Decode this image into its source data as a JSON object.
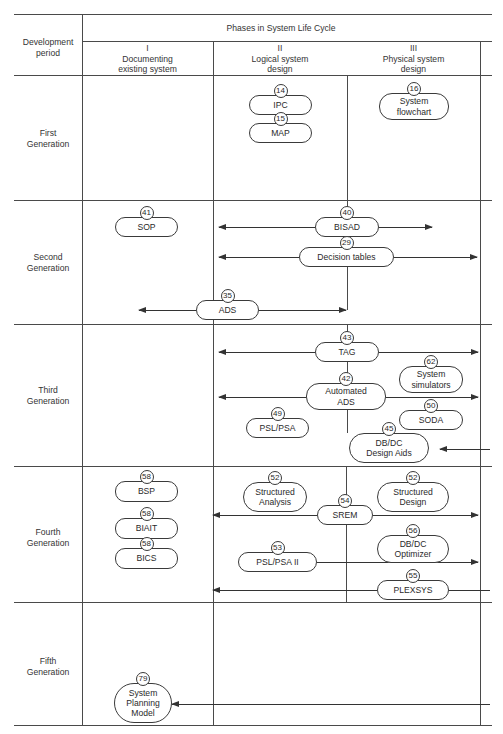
{
  "table": {
    "corner_header": "Development\nperiod",
    "phases_header": "Phases in System Life Cycle",
    "phases": [
      {
        "numeral": "I",
        "label": "Documenting\nexisting system"
      },
      {
        "numeral": "II",
        "label": "Logical system\ndesign"
      },
      {
        "numeral": "III",
        "label": "Physical system\ndesign"
      }
    ],
    "periods": [
      {
        "label": "First\nGeneration"
      },
      {
        "label": "Second\nGeneration"
      },
      {
        "label": "Third\nGeneration"
      },
      {
        "label": "Fourth\nGeneration"
      },
      {
        "label": "Fifth\nGeneration"
      }
    ]
  },
  "nodes": [
    {
      "id": "ipc",
      "num": "14",
      "label": "IPC",
      "x": 249,
      "y": 95,
      "w": 63,
      "h": 20,
      "r": 10
    },
    {
      "id": "map",
      "num": "15",
      "label": "MAP",
      "x": 249,
      "y": 123,
      "w": 63,
      "h": 20,
      "r": 10
    },
    {
      "id": "system-flowchart",
      "num": "16",
      "label": "System\nflowchart",
      "x": 379,
      "y": 93,
      "w": 70,
      "h": 27,
      "r": 13
    },
    {
      "id": "sop",
      "num": "41",
      "label": "SOP",
      "x": 115,
      "y": 217,
      "w": 63,
      "h": 20,
      "r": 10
    },
    {
      "id": "bisad",
      "num": "40",
      "label": "BISAD",
      "x": 315,
      "y": 217,
      "w": 64,
      "h": 20,
      "r": 10
    },
    {
      "id": "decision-tables",
      "num": "29",
      "label": "Decision tables",
      "x": 299,
      "y": 247,
      "w": 95,
      "h": 20,
      "r": 10
    },
    {
      "id": "ads",
      "num": "35",
      "label": "ADS",
      "x": 196,
      "y": 300,
      "w": 63,
      "h": 20,
      "r": 10
    },
    {
      "id": "tag",
      "num": "43",
      "label": "TAG",
      "x": 315,
      "y": 342,
      "w": 64,
      "h": 20,
      "r": 10
    },
    {
      "id": "system-simulators",
      "num": "62",
      "label": "System\nsimulators",
      "x": 399,
      "y": 366,
      "w": 64,
      "h": 27,
      "r": 13
    },
    {
      "id": "automated-ads",
      "num": "42",
      "label": "Automated\nADS",
      "x": 306,
      "y": 383,
      "w": 80,
      "h": 27,
      "r": 13
    },
    {
      "id": "soda",
      "num": "50",
      "label": "SODA",
      "x": 399,
      "y": 410,
      "w": 64,
      "h": 20,
      "r": 10
    },
    {
      "id": "psl-psa",
      "num": "49",
      "label": "PSL/PSA",
      "x": 246,
      "y": 418,
      "w": 63,
      "h": 20,
      "r": 10
    },
    {
      "id": "dbdc-design-aids",
      "num": "45",
      "label": "DB/DC\nDesign Aids",
      "x": 349,
      "y": 433,
      "w": 80,
      "h": 30,
      "r": 15
    },
    {
      "id": "bsp",
      "num": "58",
      "label": "BSP",
      "x": 115,
      "y": 481,
      "w": 63,
      "h": 21,
      "r": 10
    },
    {
      "id": "structured-analysis",
      "num": "52",
      "label": "Structured\nAnalysis",
      "x": 243,
      "y": 482,
      "w": 64,
      "h": 30,
      "r": 15
    },
    {
      "id": "structured-design",
      "num": "52",
      "label": "Structured\nDesign",
      "x": 377,
      "y": 482,
      "w": 72,
      "h": 30,
      "r": 15
    },
    {
      "id": "srem",
      "num": "54",
      "label": "SREM",
      "x": 317,
      "y": 505,
      "w": 56,
      "h": 20,
      "r": 10
    },
    {
      "id": "biait",
      "num": "58",
      "label": "BIAIT",
      "x": 115,
      "y": 518,
      "w": 63,
      "h": 21,
      "r": 10
    },
    {
      "id": "dbdc-optimizer",
      "num": "56",
      "label": "DB/DC\nOptimizer",
      "x": 377,
      "y": 535,
      "w": 72,
      "h": 28,
      "r": 14
    },
    {
      "id": "bics",
      "num": "58",
      "label": "BICS",
      "x": 115,
      "y": 548,
      "w": 63,
      "h": 21,
      "r": 10
    },
    {
      "id": "psl-psa-ii",
      "num": "53",
      "label": "PSL/PSA II",
      "x": 238,
      "y": 552,
      "w": 79,
      "h": 20,
      "r": 10
    },
    {
      "id": "plexsys",
      "num": "55",
      "label": "PLEXSYS",
      "x": 377,
      "y": 580,
      "w": 72,
      "h": 20,
      "r": 10
    },
    {
      "id": "system-planning-model",
      "num": "79",
      "label": "System\nPlanning\nModel",
      "x": 114,
      "y": 683,
      "w": 58,
      "h": 40,
      "r": 20
    }
  ],
  "arrows": [
    {
      "id": "bisad-left",
      "x1": 219,
      "x2": 315,
      "y": 227,
      "dir": "left"
    },
    {
      "id": "bisad-right",
      "x1": 379,
      "x2": 432,
      "y": 227,
      "dir": "right"
    },
    {
      "id": "decision-tables-left",
      "x1": 219,
      "x2": 299,
      "y": 257,
      "dir": "left"
    },
    {
      "id": "decision-tables-right",
      "x1": 394,
      "x2": 477,
      "y": 257,
      "dir": "right"
    },
    {
      "id": "ads-left",
      "x1": 139,
      "x2": 196,
      "y": 310,
      "dir": "left"
    },
    {
      "id": "ads-right",
      "x1": 259,
      "x2": 346,
      "y": 310,
      "dir": "right"
    },
    {
      "id": "tag-left",
      "x1": 219,
      "x2": 315,
      "y": 352,
      "dir": "left"
    },
    {
      "id": "tag-right",
      "x1": 379,
      "x2": 478,
      "y": 352,
      "dir": "right"
    },
    {
      "id": "automated-ads-left",
      "x1": 219,
      "x2": 306,
      "y": 397,
      "dir": "left"
    },
    {
      "id": "automated-ads-right",
      "x1": 386,
      "x2": 478,
      "y": 397,
      "dir": "right"
    },
    {
      "id": "dbdc-design-aids-in",
      "x1": 440,
      "x2": 490,
      "y": 449,
      "dir": "left"
    },
    {
      "id": "srem-left",
      "x1": 213,
      "x2": 317,
      "y": 515,
      "dir": "left"
    },
    {
      "id": "srem-right",
      "x1": 373,
      "x2": 478,
      "y": 515,
      "dir": "right"
    },
    {
      "id": "psl-psa-ii-right",
      "x1": 317,
      "x2": 478,
      "y": 562,
      "dir": "right"
    },
    {
      "id": "plexsys-left",
      "x1": 213,
      "x2": 377,
      "y": 590,
      "dir": "left"
    },
    {
      "id": "plexsys-right-tail",
      "x1": 449,
      "x2": 490,
      "y": 590,
      "dir": "none"
    },
    {
      "id": "system-planning-model-in",
      "x1": 172,
      "x2": 490,
      "y": 704,
      "dir": "left"
    }
  ],
  "connectors": [
    {
      "id": "bisad-up",
      "x": 347,
      "y1": 75,
      "y2": 217
    },
    {
      "id": "decision-tables-down",
      "x": 347,
      "y1": 267,
      "y2": 310
    },
    {
      "id": "phase2-tag-up",
      "x": 347,
      "y1": 324,
      "y2": 342
    },
    {
      "id": "tag-to-automated",
      "x": 347,
      "y1": 362,
      "y2": 383
    },
    {
      "id": "automated-down",
      "x": 347,
      "y1": 410,
      "y2": 433
    },
    {
      "id": "fourth-srem-up",
      "x": 346,
      "y1": 466,
      "y2": 505
    },
    {
      "id": "srem-down",
      "x": 346,
      "y1": 525,
      "y2": 602
    }
  ]
}
